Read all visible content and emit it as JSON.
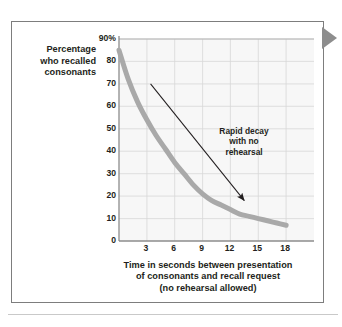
{
  "figure": {
    "edge_pointer_icon": "right-triangle-pointer-icon"
  },
  "annotation": {
    "line1": "Rapid decay",
    "line2": "with no",
    "line3": "rehearsal"
  },
  "y_axis_title": {
    "line1": "Percentage",
    "line2": "who recalled",
    "line3": "consonants"
  },
  "x_axis_title": {
    "line1": "Time in seconds between presentation",
    "line2": "of consonants and recall request",
    "line3": "(no rehearsal allowed)"
  },
  "chart_data": {
    "type": "line",
    "title": "",
    "subtitle": "",
    "xlabel": "Time in seconds between presentation of consonants and recall request (no rehearsal allowed)",
    "ylabel": "Percentage who recalled consonants",
    "xlim": [
      0,
      21
    ],
    "ylim": [
      0,
      90
    ],
    "xticks": [
      3,
      6,
      9,
      12,
      15,
      18
    ],
    "xtick_labels": [
      "3",
      "6",
      "9",
      "12",
      "15",
      "18"
    ],
    "yticks": [
      0,
      10,
      20,
      30,
      40,
      50,
      60,
      70,
      80,
      90
    ],
    "ytick_labels": [
      "0",
      "10",
      "20",
      "30",
      "40",
      "50",
      "60",
      "70",
      "80",
      "90%"
    ],
    "grid": true,
    "legend": false,
    "line_color": "#a9a9a9",
    "line_width": 5,
    "plot_background": "#f7f7f7",
    "grid_color": "#d8d8d8",
    "axis_color": "#8d8d8d",
    "series": [
      {
        "name": "Percentage who recalled consonants",
        "x": [
          0,
          1,
          2,
          3,
          4,
          5,
          6,
          7,
          8,
          9,
          10,
          11,
          12,
          13,
          14,
          15,
          16,
          17,
          18
        ],
        "values": [
          85,
          72,
          62,
          54,
          47,
          41,
          35,
          30,
          25,
          21,
          18,
          16,
          14,
          12,
          11,
          10,
          9,
          8,
          7
        ]
      }
    ],
    "annotations": [
      {
        "text": "Rapid decay with no rehearsal",
        "arrow_from": [
          3.4,
          70
        ],
        "arrow_to": [
          13.5,
          18
        ]
      }
    ]
  }
}
